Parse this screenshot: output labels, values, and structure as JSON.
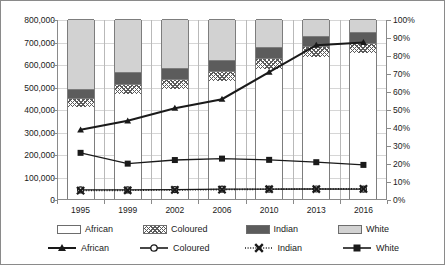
{
  "chart_data": {
    "type": "bar",
    "title": "",
    "subtitle": "",
    "xlabel": "",
    "ylabel": "",
    "y2label": "",
    "grid": true,
    "legend_position": "bottom",
    "categories": [
      "1995",
      "1999",
      "2002",
      "2006",
      "2010",
      "2013",
      "2016"
    ],
    "ylim": [
      0,
      800000
    ],
    "yticks": [
      "0",
      "100,000",
      "200,000",
      "300,000",
      "400,000",
      "500,000",
      "600,000",
      "700,000",
      "800,000"
    ],
    "ytick_values": [
      0,
      100000,
      200000,
      300000,
      400000,
      500000,
      600000,
      700000,
      800000
    ],
    "y2lim": [
      0,
      100
    ],
    "y2ticks": [
      "0%",
      "10%",
      "20%",
      "30%",
      "40%",
      "50%",
      "60%",
      "70%",
      "80%",
      "90%",
      "100%"
    ],
    "y2tick_values": [
      0,
      10,
      20,
      30,
      40,
      50,
      60,
      70,
      80,
      90,
      100
    ],
    "bar_total": 800000,
    "bar_series": [
      {
        "name": "African",
        "axis": "left",
        "fill": "white-open",
        "values": [
          410000,
          467000,
          490000,
          525000,
          578000,
          630000,
          648000
        ]
      },
      {
        "name": "Coloured",
        "axis": "left",
        "fill": "hatched",
        "values": [
          40000,
          44000,
          42000,
          45000,
          47000,
          48000,
          47000
        ]
      },
      {
        "name": "Indian",
        "axis": "left",
        "fill": "dark-gray",
        "values": [
          38000,
          53000,
          52000,
          50000,
          50000,
          48000,
          49000
        ]
      },
      {
        "name": "White",
        "axis": "left",
        "fill": "light-gray",
        "values": [
          312000,
          236000,
          216000,
          180000,
          125000,
          74000,
          56000
        ]
      }
    ],
    "line_series": [
      {
        "name": "African",
        "axis": "right",
        "marker": "triangle",
        "line": "solid",
        "values": [
          39,
          44,
          51,
          56,
          71,
          86,
          87.5
        ]
      },
      {
        "name": "Coloured",
        "axis": "right",
        "marker": "circle-open",
        "line": "solid",
        "values": [
          5.6,
          5.6,
          5.8,
          6.0,
          6.0,
          6.1,
          6.0
        ]
      },
      {
        "name": "Indian",
        "axis": "right",
        "marker": "x-bold",
        "line": "dotted",
        "values": [
          5.2,
          5.4,
          5.6,
          5.8,
          6.0,
          6.1,
          6.2
        ]
      },
      {
        "name": "White",
        "axis": "right",
        "marker": "square",
        "line": "solid",
        "values": [
          26.2,
          20.2,
          22.2,
          23.0,
          23.0,
          22.3,
          21.0,
          19.5
        ]
      }
    ],
    "line_series_white_values": [
      26.2,
      20.2,
      22.2,
      23.0,
      22.3,
      21.0,
      19.5
    ]
  },
  "legend": {
    "bar_entries": [
      {
        "label": "African",
        "swatch": "african"
      },
      {
        "label": "Coloured",
        "swatch": "coloured"
      },
      {
        "label": "Indian",
        "swatch": "indian"
      },
      {
        "label": "White",
        "swatch": "white"
      }
    ],
    "line_entries": [
      {
        "label": "African",
        "marker": "triangle-marker-icon"
      },
      {
        "label": "Coloured",
        "marker": "circle-marker-icon"
      },
      {
        "label": "Indian",
        "marker": "x-marker-icon"
      },
      {
        "label": "White",
        "marker": "square-marker-icon"
      }
    ]
  },
  "colors": {
    "african": "#ffffff",
    "coloured": "#5b5b5b",
    "indian": "#5c5c5c",
    "white": "#d2d2d2",
    "line": "#1a1a1a",
    "grid": "#d6d6d6",
    "axis": "#8a8a8a"
  }
}
